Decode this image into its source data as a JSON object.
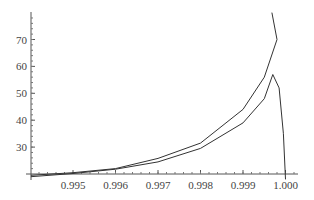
{
  "chart_data": {
    "type": "line",
    "title": "",
    "xlabel": "",
    "ylabel": "",
    "xlim": [
      0.99401,
      1.0003
    ],
    "ylim": [
      20,
      80
    ],
    "x_ticks": [
      "0.995",
      "0.996",
      "0.997",
      "0.998",
      "0.999",
      "1.000"
    ],
    "y_ticks": [
      "30",
      "40",
      "50",
      "60",
      "70"
    ],
    "grid": false,
    "series": [
      {
        "name": "upper curve",
        "x": [
          0.99401,
          0.995,
          0.996,
          0.997,
          0.998,
          0.999,
          0.9995,
          0.9998,
          0.99968
        ],
        "y": [
          19.5,
          20.5,
          22,
          25.8,
          31.5,
          44,
          56,
          70,
          80
        ]
      },
      {
        "name": "lower curve",
        "x": [
          0.99401,
          0.995,
          0.996,
          0.997,
          0.998,
          0.999,
          0.9995,
          0.9997,
          0.99985,
          0.99995,
          1.0
        ],
        "y": [
          19,
          20.2,
          21.8,
          24.5,
          29.5,
          39,
          48,
          57,
          52,
          35,
          18
        ]
      }
    ]
  }
}
